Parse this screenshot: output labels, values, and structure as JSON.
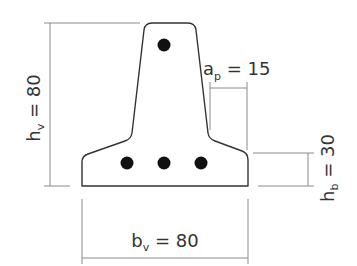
{
  "diagram": {
    "title": "",
    "colors": {
      "outline": "#333333",
      "dimension_line": "#8a8a8a",
      "rebar": "#111111",
      "text": "#333333"
    },
    "labels": {
      "height_total": {
        "symbol": "h",
        "subscript": "v",
        "equals": " = ",
        "value": "80"
      },
      "width_total": {
        "symbol": "b",
        "subscript": "v",
        "equals": " = ",
        "value": "80"
      },
      "flange_height": {
        "symbol": "h",
        "subscript": "b",
        "equals": " = ",
        "value": "30"
      },
      "projection": {
        "symbol": "a",
        "subscript": "p",
        "equals": " = ",
        "value": "15"
      }
    },
    "rebars": [
      {
        "position": "top",
        "cx": 164,
        "cy": 45
      },
      {
        "position": "bottom-left",
        "cx": 127,
        "cy": 163
      },
      {
        "position": "bottom-center",
        "cx": 164,
        "cy": 163
      },
      {
        "position": "bottom-right",
        "cx": 201,
        "cy": 163
      }
    ]
  }
}
